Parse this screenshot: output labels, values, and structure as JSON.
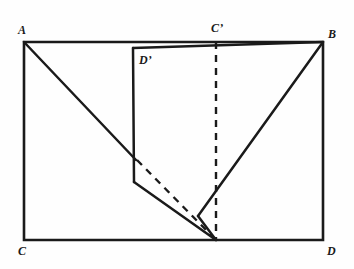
{
  "figure": {
    "background_color": "#fefefe",
    "stroke_color": "#1a1a1a",
    "canvas": {
      "width": 354,
      "height": 269
    }
  },
  "labels": {
    "a": "A",
    "b": "B",
    "c": "C",
    "d": "D",
    "c_prime": "C’",
    "d_prime": "D’"
  },
  "label_positions": {
    "a": {
      "x": 18,
      "y": 24
    },
    "b": {
      "x": 328,
      "y": 28
    },
    "c": {
      "x": 18,
      "y": 245
    },
    "d": {
      "x": 327,
      "y": 245
    },
    "c_prime": {
      "x": 211,
      "y": 22
    },
    "d_prime": {
      "x": 139,
      "y": 54
    }
  },
  "points": {
    "A": {
      "x": 24,
      "y": 42,
      "name": "rectangle-top-left"
    },
    "B": {
      "x": 323,
      "y": 42,
      "name": "rectangle-top-right"
    },
    "C": {
      "x": 24,
      "y": 240,
      "name": "rectangle-bottom-left"
    },
    "D": {
      "x": 323,
      "y": 240,
      "name": "rectangle-bottom-right"
    },
    "Cp": {
      "x": 216,
      "y": 42,
      "name": "c-prime-on-top-edge"
    },
    "Cp_foot": {
      "x": 216,
      "y": 240,
      "name": "c-prime-foot-on-bottom-edge"
    },
    "Dp": {
      "x": 133,
      "y": 48,
      "name": "d-prime-flap-top-left"
    },
    "K": {
      "x": 136,
      "y": 160,
      "name": "crease-intersection-upper"
    },
    "L": {
      "x": 134,
      "y": 182,
      "name": "flap-left-bend"
    },
    "M": {
      "x": 198,
      "y": 216,
      "name": "b-diagonal-lower-vertex"
    }
  },
  "segments": {
    "rectangle": "A-B-D-C closed outline",
    "a_diagonal": "A to crease-intersection K",
    "flap_top": "D’ to B",
    "flap_left": "D’ down to L",
    "flap_bottom": "L to C’ foot",
    "b_diagonal": "B to M",
    "m_to_foot": "M to C’ foot",
    "dashed_vertical": "C’ to C’ foot",
    "dashed_crease": "K to C’ foot"
  },
  "style": {
    "solid_width": 2.4,
    "rect_width": 2.6,
    "dash_width": 2.4,
    "dash_pattern": "7,6"
  }
}
